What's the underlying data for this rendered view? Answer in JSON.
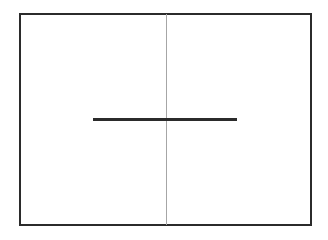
{
  "diagram": {
    "background": "#ffffff",
    "frame": {
      "x": 19,
      "y": 13,
      "width": 293,
      "height": 213,
      "border_width": 2,
      "color": "#2b2b2b"
    },
    "vertical_line": {
      "x": 166,
      "y1": 14,
      "y2": 225,
      "thickness": 1,
      "color": "#a6a6a6"
    },
    "horizontal_line": {
      "x1": 93,
      "x2": 237,
      "y": 118,
      "thickness": 3,
      "color": "#2b2b2b"
    }
  }
}
